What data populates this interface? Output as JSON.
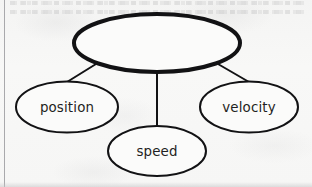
{
  "diagram": {
    "type": "concept-map",
    "background_color": "#f7f7f6",
    "stroke_color": "#121214",
    "text_color": "#1f1f22",
    "root": {
      "id": "root",
      "label": "",
      "shape": "ellipse",
      "stroke_width": 4,
      "cx": 157,
      "cy": 43,
      "rx": 83,
      "ry": 29
    },
    "children": [
      {
        "id": "position",
        "label": "position",
        "shape": "ellipse",
        "stroke_width": 2,
        "cx": 67,
        "cy": 107,
        "rx": 51,
        "ry": 25.5,
        "label_x": 67,
        "label_y": 112
      },
      {
        "id": "speed",
        "label": "speed",
        "shape": "ellipse",
        "stroke_width": 2,
        "cx": 157,
        "cy": 151,
        "rx": 49,
        "ry": 25,
        "label_x": 157,
        "label_y": 156
      },
      {
        "id": "velocity",
        "label": "velocity",
        "shape": "ellipse",
        "stroke_width": 2,
        "cx": 249,
        "cy": 107,
        "rx": 49,
        "ry": 25.5,
        "label_x": 249,
        "label_y": 112
      }
    ],
    "edges": [
      {
        "id": "edge-root-position",
        "from": "root",
        "to": "position",
        "x1": 96,
        "y1": 64,
        "x2": 67,
        "y2": 82,
        "stroke_width": 2
      },
      {
        "id": "edge-root-speed",
        "from": "root",
        "to": "speed",
        "x1": 157,
        "y1": 72,
        "x2": 157,
        "y2": 126,
        "stroke_width": 2
      },
      {
        "id": "edge-root-velocity",
        "from": "root",
        "to": "velocity",
        "x1": 218,
        "y1": 64,
        "x2": 249,
        "y2": 82,
        "stroke_width": 2
      }
    ],
    "margin_rule": {
      "id": "margin-rule",
      "color": "#9b9b9f"
    }
  }
}
